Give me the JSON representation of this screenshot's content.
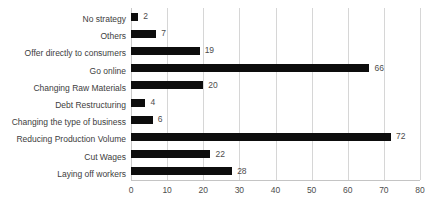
{
  "chart_data": {
    "type": "bar",
    "orientation": "horizontal",
    "title": "",
    "subtitle": "",
    "xlabel": "",
    "ylabel": "",
    "xlim": [
      0,
      80
    ],
    "xticks": [
      0,
      10,
      20,
      30,
      40,
      50,
      60,
      70,
      80
    ],
    "grid": true,
    "grid_axis": "x",
    "legend": false,
    "legend_position": "none",
    "categories": [
      "No strategy",
      "Others",
      "Offer directly to consumers",
      "Go online",
      "Changing Raw Materials",
      "Debt Restructuring",
      "Changing the type of business",
      "Reducing Production Volume",
      "Cut Wages",
      "Laying off workers"
    ],
    "values": [
      2,
      7,
      19,
      66,
      20,
      4,
      6,
      72,
      22,
      28
    ],
    "data_labels": [
      "2",
      "7",
      "19",
      "66",
      "20",
      "4",
      "6",
      "72",
      "22",
      "28"
    ],
    "bar_color": "#0d0d0d",
    "grid_color": "#d6d6d6",
    "label_color": "#3d3d3d",
    "value_color": "#4d4d4d",
    "background": "#ffffff"
  }
}
